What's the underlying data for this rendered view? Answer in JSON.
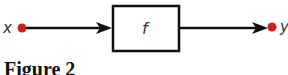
{
  "diagram": {
    "input": {
      "label": "x",
      "dot_color": "#cc1f1f"
    },
    "function": {
      "label": "f"
    },
    "output": {
      "label": "y",
      "dot_color": "#cc1f1f"
    },
    "line_color": "#111111"
  },
  "caption": {
    "text": "Figure 2"
  }
}
